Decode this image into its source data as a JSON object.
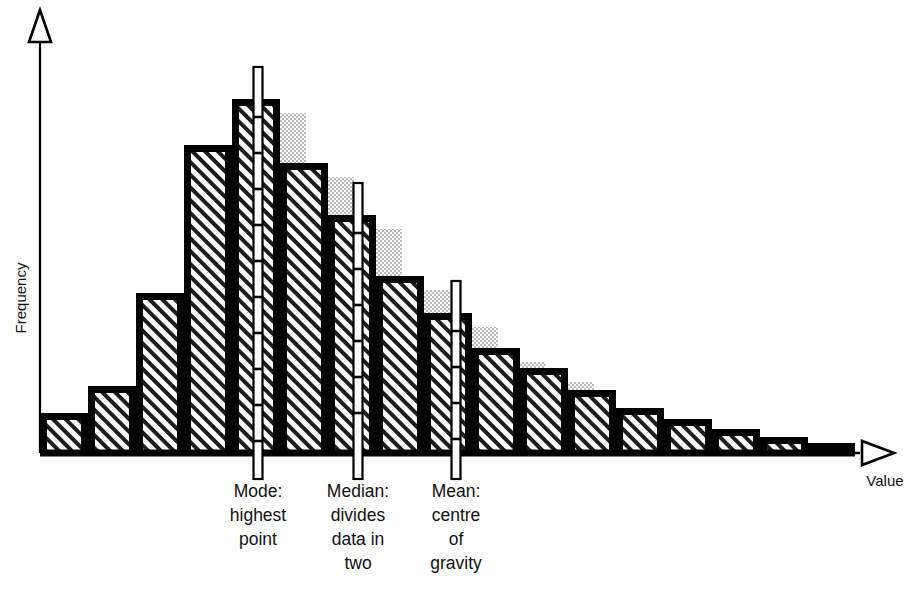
{
  "figure": {
    "kind": "statistics-histogram-diagram",
    "background_color": "#ffffff",
    "ink_color": "#000000",
    "shadow_color": "#c8c8c8",
    "hatch_color": "#1a1a1a"
  },
  "axes": {
    "y_label": "Frequency",
    "x_label": "Value",
    "y_arrow": "open-triangle-up",
    "x_arrow": "open-triangle-right",
    "gridlines": "none",
    "tick_labels": "none"
  },
  "annotations": [
    {
      "id": "mode",
      "marker_x": 258,
      "lines": [
        "Mode:",
        "highest",
        "point"
      ],
      "text_x": 258
    },
    {
      "id": "median",
      "marker_x": 358,
      "lines": [
        "Median:",
        "divides",
        "data in",
        "two"
      ],
      "text_x": 358
    },
    {
      "id": "mean",
      "marker_x": 456,
      "lines": [
        "Mean:",
        "centre",
        "of",
        "gravity"
      ],
      "text_x": 456
    }
  ],
  "chart_data": {
    "type": "bar",
    "title": "",
    "subtitle": "",
    "xlabel": "Value",
    "ylabel": "Frequency",
    "grid": false,
    "legend": "none",
    "xlim": [
      0,
      17
    ],
    "ylim": [
      0,
      100
    ],
    "categories": [
      "1",
      "2",
      "3",
      "4",
      "5",
      "6",
      "7",
      "8",
      "9",
      "10",
      "11",
      "12",
      "13",
      "14",
      "15",
      "16",
      "17"
    ],
    "values": [
      11,
      19,
      45,
      87,
      100,
      82,
      67,
      50,
      40,
      30,
      24,
      18,
      13,
      9,
      6,
      4,
      3
    ],
    "annotations": [
      {
        "label": "Mode: highest point",
        "at_category": "5"
      },
      {
        "label": "Median: divides data in two",
        "at_category": "7"
      },
      {
        "label": "Mean: centre of gravity",
        "at_category": "9"
      }
    ]
  },
  "bars": [
    {
      "i": 0,
      "x": 40,
      "w": 48,
      "top": 413,
      "shadow": false
    },
    {
      "i": 1,
      "x": 88,
      "w": 48,
      "top": 386,
      "shadow": false
    },
    {
      "i": 2,
      "x": 136,
      "w": 48,
      "top": 293,
      "shadow": false
    },
    {
      "i": 3,
      "x": 184,
      "w": 48,
      "top": 145,
      "shadow": false
    },
    {
      "i": 4,
      "x": 232,
      "w": 48,
      "top": 99,
      "shadow": true
    },
    {
      "i": 5,
      "x": 280,
      "w": 48,
      "top": 163,
      "shadow": true
    },
    {
      "i": 6,
      "x": 328,
      "w": 48,
      "top": 215,
      "shadow": true
    },
    {
      "i": 7,
      "x": 376,
      "w": 48,
      "top": 276,
      "shadow": true
    },
    {
      "i": 8,
      "x": 424,
      "w": 48,
      "top": 313,
      "shadow": true
    },
    {
      "i": 9,
      "x": 472,
      "w": 48,
      "top": 348,
      "shadow": true
    },
    {
      "i": 10,
      "x": 520,
      "w": 48,
      "top": 368,
      "shadow": true
    },
    {
      "i": 11,
      "x": 568,
      "w": 48,
      "top": 390,
      "shadow": false
    },
    {
      "i": 12,
      "x": 616,
      "w": 48,
      "top": 408,
      "shadow": true
    },
    {
      "i": 13,
      "x": 664,
      "w": 48,
      "top": 419,
      "shadow": false
    },
    {
      "i": 14,
      "x": 712,
      "w": 48,
      "top": 429,
      "shadow": false
    },
    {
      "i": 15,
      "x": 760,
      "w": 48,
      "top": 437,
      "shadow": false
    },
    {
      "i": 16,
      "x": 808,
      "w": 47,
      "top": 443,
      "shadow": false
    }
  ],
  "geometry": {
    "baseline_y": 453,
    "axis_x": 40,
    "axis_top_y": 22,
    "x_axis_end": 880,
    "marker_top_extra": 32
  }
}
